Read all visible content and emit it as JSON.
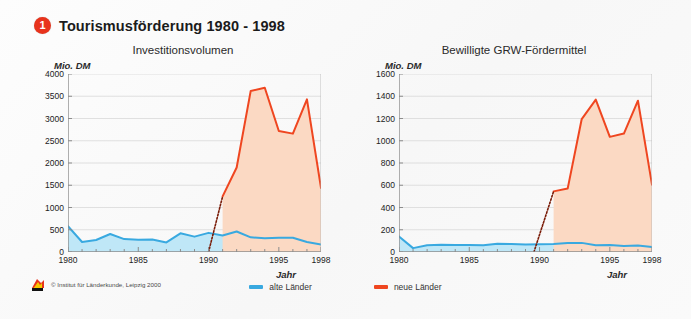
{
  "header": {
    "badge_number": "1",
    "title": "Tourismusförderung 1980 - 1998",
    "badge_color": "#e8331c"
  },
  "legend": {
    "items": [
      {
        "label": "alte Länder",
        "color": "#39a9e0"
      },
      {
        "label": "neue Länder",
        "color": "#ef4620"
      }
    ]
  },
  "credit": {
    "text": "© Institut für Länderkunde, Leipzig 2000",
    "logo_icon": "ifl-logo-icon"
  },
  "chart_data": [
    {
      "type": "area",
      "id": "investitionsvolumen",
      "title": "Investitionsvolumen",
      "ylabel": "Mio. DM",
      "xlabel": "Jahr",
      "ylim": [
        0,
        4000
      ],
      "yticks": [
        0,
        500,
        1000,
        1500,
        2000,
        2500,
        3000,
        3500,
        4000
      ],
      "ytick_labels": [
        "0",
        "500",
        "1000",
        "1500",
        "2000",
        "2500",
        "3000",
        "3500",
        "4000"
      ],
      "xlim": [
        1980,
        1998
      ],
      "xticks": [
        1980,
        1985,
        1990,
        1995,
        1998
      ],
      "xtick_labels": [
        "1980",
        "1985",
        "1990",
        "1995",
        "1998"
      ],
      "grid": true,
      "legend_position": "bottom-center",
      "x": [
        1980,
        1981,
        1982,
        1983,
        1984,
        1985,
        1986,
        1987,
        1988,
        1989,
        1990,
        1991,
        1992,
        1993,
        1994,
        1995,
        1996,
        1997,
        1998
      ],
      "series": [
        {
          "name": "alte Länder",
          "color": "#39a9e0",
          "fill": "#bfe7f7",
          "values": [
            580,
            225,
            270,
            405,
            290,
            275,
            280,
            215,
            420,
            345,
            430,
            370,
            460,
            330,
            310,
            320,
            320,
            225,
            170
          ]
        },
        {
          "name": "neue Länder",
          "color": "#ef4620",
          "fill": "#fbd9c3",
          "start_year": 1991,
          "dotted_from": {
            "year": 1990,
            "value": 0
          },
          "values": [
            null,
            null,
            null,
            null,
            null,
            null,
            null,
            null,
            null,
            null,
            null,
            1250,
            1900,
            3620,
            3690,
            2720,
            2660,
            3430,
            1440
          ]
        }
      ]
    },
    {
      "type": "area",
      "id": "grw-foerdermittel",
      "title": "Bewilligte GRW-Fördermittel",
      "ylabel": "Mio. DM",
      "xlabel": "Jahr",
      "ylim": [
        0,
        1600
      ],
      "yticks": [
        0,
        200,
        400,
        600,
        800,
        1000,
        1200,
        1400,
        1600
      ],
      "ytick_labels": [
        "0",
        "200",
        "400",
        "600",
        "800",
        "1000",
        "1200",
        "1400",
        "1600"
      ],
      "xlim": [
        1980,
        1998
      ],
      "xticks": [
        1980,
        1985,
        1990,
        1995,
        1998
      ],
      "xtick_labels": [
        "1980",
        "1985",
        "1990",
        "1995",
        "1998"
      ],
      "grid": true,
      "legend_position": "bottom-center",
      "x": [
        1980,
        1981,
        1982,
        1983,
        1984,
        1985,
        1986,
        1987,
        1988,
        1989,
        1990,
        1991,
        1992,
        1993,
        1994,
        1995,
        1996,
        1997,
        1998
      ],
      "series": [
        {
          "name": "alte Länder",
          "color": "#39a9e0",
          "fill": "#bfe7f7",
          "values": [
            140,
            35,
            60,
            65,
            63,
            62,
            60,
            75,
            72,
            68,
            70,
            72,
            80,
            82,
            60,
            62,
            55,
            58,
            45
          ]
        },
        {
          "name": "neue Länder",
          "color": "#ef4620",
          "fill": "#fbd9c3",
          "start_year": 1991,
          "dotted_from": {
            "year": 1989.6,
            "value": 0
          },
          "values": [
            null,
            null,
            null,
            null,
            null,
            null,
            null,
            null,
            null,
            null,
            null,
            545,
            570,
            1195,
            1370,
            1035,
            1065,
            1360,
            605
          ]
        }
      ]
    }
  ]
}
